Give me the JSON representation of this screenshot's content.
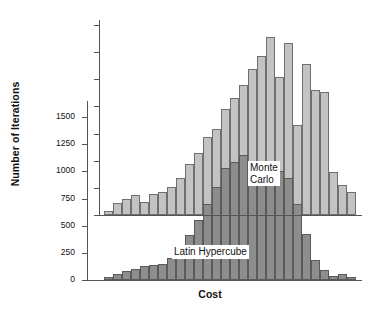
{
  "chart_data": {
    "type": "bar",
    "title": "",
    "subtitle": "",
    "xlabel": "Cost",
    "ylabel": "Number of Iterations",
    "grid": false,
    "legend_position": "inline-annotation",
    "y_tick_labels": [
      "0",
      "250",
      "500",
      "750",
      "1000",
      "1250",
      "1500"
    ],
    "y_tick_values": [
      0,
      250,
      500,
      750,
      1000,
      1250,
      1500
    ],
    "ylim": [
      0,
      1750
    ],
    "x_tick_labels": [],
    "annotations": [
      {
        "text": "Monte\nCarlo",
        "series": "Monte Carlo"
      },
      {
        "text": "Latin Hypercube",
        "series": "Latin Hypercube"
      }
    ],
    "colors": {
      "monte_carlo_fill": "#c3c3c3",
      "monte_carlo_edge": "#6f6f6f",
      "latin_hypercube_fill": "#8d8d8d",
      "latin_hypercube_edge": "#5a5a5a",
      "axis": "#555555",
      "text": "#111111",
      "background": "#ffffff"
    },
    "categories": [
      "b1",
      "b2",
      "b3",
      "b4",
      "b5",
      "b6",
      "b7",
      "b8",
      "b9",
      "b10",
      "b11",
      "b12",
      "b13",
      "b14",
      "b15",
      "b16",
      "b17",
      "b18",
      "b19",
      "b20",
      "b21",
      "b22",
      "b23",
      "b24",
      "b25",
      "b26",
      "b27",
      "b28"
    ],
    "series": [
      {
        "name": "Monte Carlo",
        "fill": "#c3c3c3",
        "baseline_note": "plotted on upper axis, own zero line",
        "values": [
          40,
          110,
          150,
          180,
          120,
          190,
          210,
          260,
          340,
          470,
          570,
          720,
          790,
          980,
          1080,
          1200,
          1340,
          1460,
          1640,
          1270,
          1580,
          830,
          1390,
          1150,
          1130,
          400,
          280,
          210
        ]
      },
      {
        "name": "Latin Hypercube",
        "fill": "#8d8d8d",
        "baseline_note": "plotted on lower axis, zero at 0",
        "values": [
          25,
          55,
          80,
          105,
          125,
          135,
          150,
          205,
          305,
          415,
          555,
          700,
          860,
          1030,
          1090,
          1155,
          1090,
          1000,
          940,
          1005,
          940,
          700,
          420,
          180,
          90,
          35,
          55,
          30
        ]
      }
    ]
  }
}
